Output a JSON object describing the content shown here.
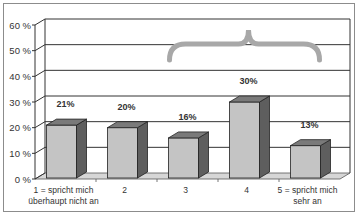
{
  "chart_data": {
    "type": "bar",
    "title": "",
    "xlabel": "",
    "ylabel": "",
    "categories": [
      "1 = spricht mich überhaupt nicht an",
      "2",
      "3",
      "4",
      "5 = spricht mich sehr an"
    ],
    "category_lines": [
      [
        "1 = spricht mich",
        "überhaupt nicht an"
      ],
      [
        "2"
      ],
      [
        "3"
      ],
      [
        "4"
      ],
      [
        "5 = spricht mich",
        "sehr an"
      ]
    ],
    "values": [
      21,
      20,
      16,
      30,
      13
    ],
    "data_labels": [
      "21%",
      "20%",
      "16%",
      "30%",
      "13%"
    ],
    "ylim": [
      0,
      60
    ],
    "yticks": [
      "0 %",
      "10 %",
      "20 %",
      "30 %",
      "40 %",
      "50 %",
      "60 %"
    ],
    "grid": true,
    "legend": "none",
    "style": "3d-column",
    "annotations": [
      {
        "type": "curly-brace",
        "spans_categories": [
          "3",
          "4",
          "5 = spricht mich sehr an"
        ],
        "color": "#a8a8a8"
      }
    ],
    "colors": {
      "bar_front": "#c4c4c4",
      "bar_side": "#5e5e5e",
      "bar_top": "#7a7a7a",
      "floor": "#d6d6d6",
      "grid": "#333333",
      "brace": "#a8a8a8"
    }
  }
}
